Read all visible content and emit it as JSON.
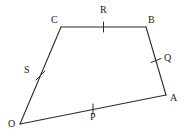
{
  "figure": {
    "type": "quadrilateral-with-midpoints",
    "stroke_color": "#2b2b2b",
    "tick_color": "#2b2b2b",
    "background_color": "#ffffff",
    "stroke_width": 1.1,
    "vertices": [
      {
        "name": "O",
        "label": "O",
        "x": 20,
        "y": 124,
        "label_x": 10,
        "label_y": 124
      },
      {
        "name": "C",
        "label": "C",
        "x": 61,
        "y": 27,
        "label_x": 53,
        "label_y": 20
      },
      {
        "name": "B",
        "label": "B",
        "x": 146,
        "y": 27,
        "label_x": 148,
        "label_y": 20
      },
      {
        "name": "A",
        "label": "A",
        "x": 166,
        "y": 95,
        "label_x": 170,
        "label_y": 99
      }
    ],
    "edges": [
      {
        "name": "edge-OC",
        "from": "O",
        "to": "C"
      },
      {
        "name": "edge-CB",
        "from": "C",
        "to": "B"
      },
      {
        "name": "edge-BA",
        "from": "B",
        "to": "A"
      },
      {
        "name": "edge-AO",
        "from": "A",
        "to": "O"
      }
    ],
    "midpoints": [
      {
        "name": "R",
        "label": "R",
        "on_edge": "edge-CB",
        "x": 103.5,
        "y": 27,
        "tick_x1": 103.5,
        "tick_y1": 22,
        "tick_x2": 103.5,
        "tick_y2": 32,
        "label_x": 100,
        "label_y": 9
      },
      {
        "name": "Q",
        "label": "Q",
        "on_edge": "edge-BA",
        "x": 156,
        "y": 61,
        "tick_x1": 151,
        "tick_y1": 62.5,
        "tick_x2": 161,
        "tick_y2": 58.5,
        "label_x": 164,
        "label_y": 57
      },
      {
        "name": "P",
        "label": "P",
        "on_edge": "edge-AO",
        "x": 93,
        "y": 110,
        "tick_x1": 93,
        "tick_y1": 104,
        "tick_x2": 93,
        "tick_y2": 114,
        "label_x": 90,
        "label_y": 116
      },
      {
        "name": "S",
        "label": "S",
        "on_edge": "edge-OC",
        "x": 40.5,
        "y": 75.5,
        "tick_x1": 36,
        "tick_y1": 80,
        "tick_x2": 45,
        "tick_y2": 71,
        "label_x": 25,
        "label_y": 70
      }
    ]
  }
}
